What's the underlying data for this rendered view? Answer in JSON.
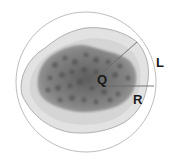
{
  "diagram": {
    "type": "cell-schematic",
    "labels": {
      "center": "Q",
      "chord": "L",
      "radius": "R"
    },
    "colors": {
      "outer_circle": "#b8b8b8",
      "cytoplasm_fill": "#e4e4e4",
      "cytoplasm_edge": "#9a9a9a",
      "nucleus_fill": "#7d7d7d",
      "nucleus_spots": "#4f4f4f",
      "lines": "#6a6a6a",
      "label_text": "#1a1a1a"
    }
  }
}
